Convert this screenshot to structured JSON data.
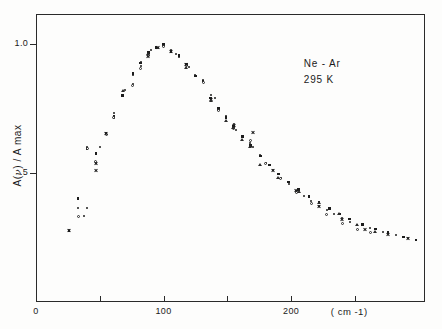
{
  "chart_data": {
    "type": "scatter",
    "title": "",
    "xlabel": "( cm -1)",
    "ylabel": "A( ν ) / A max",
    "ylabel_prefix": "A(",
    "ylabel_nu": "ν",
    "ylabel_suffix": ") / A max",
    "xunit": "( cm -1)",
    "xlim": [
      0,
      305
    ],
    "ylim": [
      0.0,
      1.115
    ],
    "grid": false,
    "legend": false,
    "annotations": [
      "Ne - Ar",
      "295 K"
    ],
    "annotation_sample": "Ne - Ar",
    "annotation_temperature": "295 K",
    "x_ticks": [
      0,
      50,
      100,
      150,
      200,
      250
    ],
    "x_tick_labels": [
      "0",
      "",
      "100",
      "",
      "200",
      ""
    ],
    "y_ticks": [
      0.5,
      1.0
    ],
    "y_tick_labels": [
      ".5",
      "1.0"
    ],
    "series": [
      {
        "name": "run-1",
        "marker": "dot",
        "x": [
          26,
          33,
          33,
          38,
          40,
          40,
          47,
          47,
          50,
          55,
          61,
          61,
          68,
          70,
          76,
          76,
          82,
          82,
          88,
          90,
          96,
          100,
          100,
          106,
          110,
          112,
          118,
          120,
          125,
          131,
          137,
          140,
          143,
          149,
          155,
          157,
          162,
          168,
          170,
          176,
          180,
          186,
          192,
          198,
          204,
          210,
          216,
          222,
          228,
          234,
          240,
          246,
          252,
          262,
          272,
          282,
          292
        ],
        "y": [
          0.278,
          0.363,
          0.4,
          0.333,
          0.363,
          0.6,
          0.538,
          0.577,
          0.6,
          0.65,
          0.713,
          0.73,
          0.8,
          0.82,
          0.845,
          0.88,
          0.915,
          0.93,
          0.96,
          0.975,
          0.985,
          0.995,
          1.0,
          0.975,
          0.96,
          0.95,
          0.92,
          0.91,
          0.88,
          0.86,
          0.8,
          0.79,
          0.745,
          0.72,
          0.69,
          0.665,
          0.64,
          0.615,
          0.6,
          0.57,
          0.54,
          0.51,
          0.48,
          0.455,
          0.43,
          0.41,
          0.39,
          0.37,
          0.355,
          0.34,
          0.325,
          0.31,
          0.3,
          0.285,
          0.27,
          0.258,
          0.248
        ]
      },
      {
        "name": "run-2",
        "marker": "square",
        "x": [
          26,
          33,
          40,
          47,
          55,
          61,
          68,
          76,
          82,
          88,
          94,
          100,
          106,
          112,
          118,
          125,
          131,
          137,
          143,
          149,
          155,
          162,
          168,
          176,
          183,
          190,
          198,
          206,
          214,
          222,
          230,
          238,
          246,
          256,
          266,
          276,
          288,
          298
        ],
        "y": [
          0.275,
          0.4,
          0.595,
          0.575,
          0.655,
          0.72,
          0.8,
          0.885,
          0.925,
          0.965,
          0.985,
          0.998,
          0.97,
          0.955,
          0.92,
          0.875,
          0.855,
          0.79,
          0.75,
          0.715,
          0.68,
          0.64,
          0.605,
          0.565,
          0.53,
          0.495,
          0.465,
          0.435,
          0.408,
          0.385,
          0.362,
          0.34,
          0.322,
          0.3,
          0.282,
          0.268,
          0.252,
          0.24
        ]
      },
      {
        "name": "run-3",
        "marker": "circle",
        "x": [
          33,
          40,
          47,
          55,
          61,
          76,
          82,
          88,
          100,
          118,
          131,
          143,
          155,
          168,
          180,
          192,
          204,
          216,
          228,
          240,
          252,
          262
        ],
        "y": [
          0.33,
          0.595,
          0.545,
          0.65,
          0.715,
          0.84,
          0.905,
          0.955,
          0.99,
          0.915,
          0.85,
          0.74,
          0.672,
          0.625,
          0.535,
          0.478,
          0.425,
          0.382,
          0.338,
          0.305,
          0.282,
          0.268
        ]
      },
      {
        "name": "run-4",
        "marker": "cross",
        "x": [
          26,
          47,
          47,
          55,
          88,
          96,
          106,
          118,
          137,
          155,
          170,
          186,
          204,
          222,
          240,
          258,
          276,
          292
        ],
        "y": [
          0.278,
          0.538,
          0.51,
          0.652,
          0.952,
          0.985,
          0.968,
          0.918,
          0.785,
          0.685,
          0.655,
          0.508,
          0.43,
          0.37,
          0.318,
          0.282,
          0.262,
          0.245
        ]
      },
      {
        "name": "run-5",
        "marker": "triangle",
        "x": [
          68,
          88,
          118,
          137,
          149,
          155,
          162,
          168,
          176,
          190,
          206,
          222,
          238,
          252,
          266
        ],
        "y": [
          0.815,
          0.962,
          0.905,
          0.78,
          0.7,
          0.672,
          0.628,
          0.6,
          0.53,
          0.48,
          0.425,
          0.382,
          0.34,
          0.3,
          0.272
        ]
      }
    ]
  },
  "axes_geometry": {
    "left_px": 36,
    "right_px": 425,
    "top_px": 14,
    "bottom_px": 302,
    "y_value_top": 1.115,
    "y_value_bottom": 0.0,
    "x_value_left": 0,
    "x_value_right": 305
  },
  "figure": {
    "background_color": "#fdfdfc",
    "ink_color": "#1c1c1c",
    "frame_color": "#2a2a2a"
  }
}
